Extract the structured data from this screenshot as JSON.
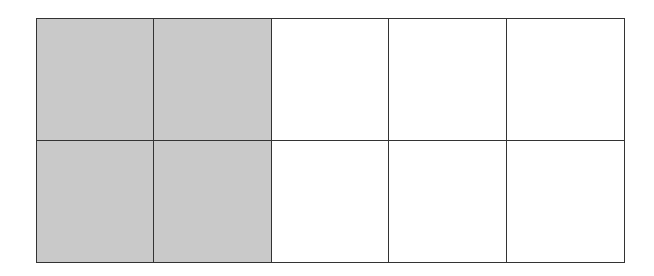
{
  "diagram": {
    "type": "fraction-grid",
    "rows": 2,
    "columns": 5,
    "shaded_color": "#c9c9c9",
    "unshaded_color": "#ffffff",
    "line_color": "#333333",
    "cells": [
      [
        true,
        true,
        false,
        false,
        false
      ],
      [
        true,
        true,
        false,
        false,
        false
      ]
    ],
    "shaded_count": 4,
    "total_count": 10
  }
}
